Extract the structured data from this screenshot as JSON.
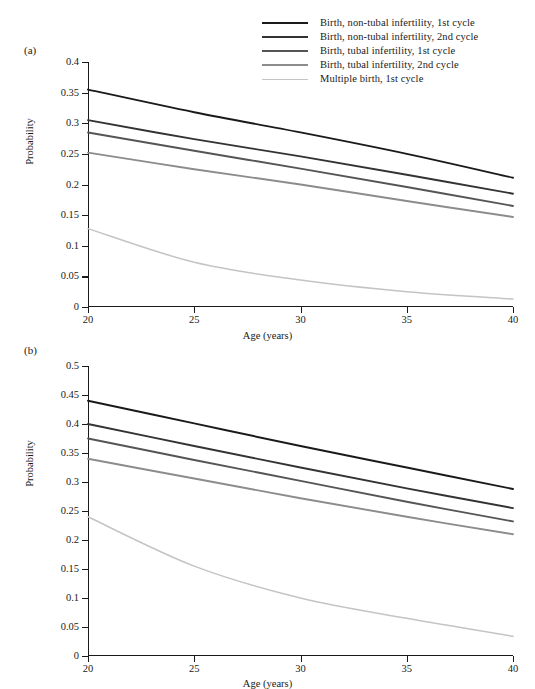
{
  "legend": {
    "position": "top-right",
    "items": [
      {
        "label": "Birth, non-tubal infertility, 1st cycle",
        "color": "#1a1a1a"
      },
      {
        "label": "Birth, non-tubal infertility, 2nd cycle",
        "color": "#333333"
      },
      {
        "label": "Birth, tubal infertility, 1st cycle",
        "color": "#555555"
      },
      {
        "label": "Birth, tubal infertility, 2nd cycle",
        "color": "#8c8c8c"
      },
      {
        "label": "Multiple birth, 1st cycle",
        "color": "#c4c4c4"
      }
    ]
  },
  "panels": [
    {
      "tag": "(a)",
      "xlabel": "Age (years)",
      "ylabel": "Probability"
    },
    {
      "tag": "(b)",
      "xlabel": "Age (years)",
      "ylabel": "Probability"
    }
  ],
  "chart_data": [
    {
      "type": "line",
      "title": "(a)",
      "xlabel": "Age (years)",
      "ylabel": "Probability",
      "x": [
        20,
        25,
        30,
        35,
        40
      ],
      "xlim": [
        20,
        40
      ],
      "ylim": [
        0,
        0.4
      ],
      "xticks": [
        20,
        25,
        30,
        35,
        40
      ],
      "yticks": [
        0,
        0.05,
        0.1,
        0.15,
        0.2,
        0.25,
        0.3,
        0.35,
        0.4
      ],
      "ytick_labels": [
        "0",
        "0.05",
        "0.1",
        "0.15",
        "0.2",
        "0.25",
        "0.3",
        "0.35",
        "0.4"
      ],
      "xtick_labels": [
        "20",
        "25",
        "30",
        "35",
        "40"
      ],
      "grid": false,
      "legend_position": "top-right",
      "series": [
        {
          "name": "Birth, non-tubal infertility, 1st cycle",
          "color": "#1a1a1a",
          "values": [
            0.355,
            0.318,
            0.285,
            0.25,
            0.211
          ]
        },
        {
          "name": "Birth, non-tubal infertility, 2nd cycle",
          "color": "#333333",
          "values": [
            0.305,
            0.274,
            0.246,
            0.216,
            0.185
          ]
        },
        {
          "name": "Birth, tubal infertility, 1st cycle",
          "color": "#555555",
          "values": [
            0.285,
            0.255,
            0.226,
            0.196,
            0.165
          ]
        },
        {
          "name": "Birth, tubal infertility, 2nd cycle",
          "color": "#8c8c8c",
          "values": [
            0.252,
            0.225,
            0.2,
            0.173,
            0.147
          ]
        },
        {
          "name": "Multiple birth, 1st cycle",
          "color": "#c4c4c4",
          "values": [
            0.128,
            0.073,
            0.044,
            0.025,
            0.013
          ]
        }
      ]
    },
    {
      "type": "line",
      "title": "(b)",
      "xlabel": "Age (years)",
      "ylabel": "Probability",
      "x": [
        20,
        25,
        30,
        35,
        40
      ],
      "xlim": [
        20,
        40
      ],
      "ylim": [
        0,
        0.5
      ],
      "xticks": [
        20,
        25,
        30,
        35,
        40
      ],
      "yticks": [
        0,
        0.05,
        0.1,
        0.15,
        0.2,
        0.25,
        0.3,
        0.35,
        0.4,
        0.45,
        0.5
      ],
      "ytick_labels": [
        "0",
        "0.05",
        "0.1",
        "0.15",
        "0.2",
        "0.25",
        "0.3",
        "0.35",
        "0.4",
        "0.45",
        "0.5"
      ],
      "xtick_labels": [
        "20",
        "25",
        "30",
        "35",
        "40"
      ],
      "grid": false,
      "legend_position": "top-right",
      "series": [
        {
          "name": "Birth, non-tubal infertility, 1st cycle",
          "color": "#1a1a1a",
          "values": [
            0.44,
            0.401,
            0.362,
            0.325,
            0.288
          ]
        },
        {
          "name": "Birth, non-tubal infertility, 2nd cycle",
          "color": "#333333",
          "values": [
            0.4,
            0.362,
            0.325,
            0.289,
            0.255
          ]
        },
        {
          "name": "Birth, tubal infertility, 1st cycle",
          "color": "#555555",
          "values": [
            0.375,
            0.338,
            0.302,
            0.266,
            0.232
          ]
        },
        {
          "name": "Birth, tubal infertility, 2nd cycle",
          "color": "#8c8c8c",
          "values": [
            0.34,
            0.306,
            0.272,
            0.24,
            0.21
          ]
        },
        {
          "name": "Multiple birth, 1st cycle",
          "color": "#c4c4c4",
          "values": [
            0.24,
            0.155,
            0.1,
            0.065,
            0.034
          ]
        }
      ]
    }
  ]
}
